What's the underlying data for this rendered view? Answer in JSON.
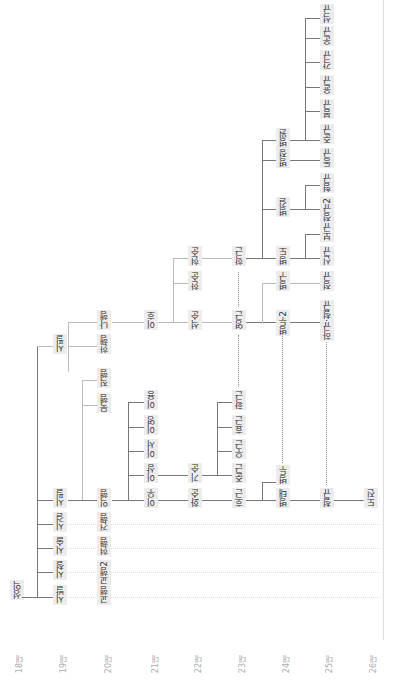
{
  "generations": [
    "18대",
    "19대",
    "20대",
    "21대",
    "22대",
    "23대",
    "24대",
    "25대",
    "26대"
  ],
  "root": "성익",
  "gen19": [
    "시발",
    "시철",
    "시술",
    "시걸",
    "시필",
    "시필2"
  ],
  "gen20": [
    "교행",
    "교행2",
    "현행",
    "건행",
    "익행",
    "묵행",
    "직행",
    "한행",
    "나행"
  ],
  "gen21": [
    "이우",
    "이상",
    "이서",
    "이영",
    "이용",
    "이강",
    "이호"
  ],
  "gen22": [
    "화순",
    "기순",
    "석순",
    "한순",
    "현순"
  ],
  "gen23": [
    "호근",
    "준근",
    "우근",
    "효근",
    "인근",
    "확근",
    "영근",
    "학근"
  ],
  "gen24": [
    "병태",
    "병두",
    "병두2",
    "병구",
    "병도",
    "병길",
    "병정",
    "병원"
  ],
  "gen25": [
    "철규",
    "하규·철규",
    "정규",
    "신규",
    "보규",
    "정규2",
    "형규",
    "동규",
    "준규",
    "봉규",
    "윤규",
    "각규",
    "운규",
    "석규"
  ],
  "gen26": [
    "도진"
  ]
}
